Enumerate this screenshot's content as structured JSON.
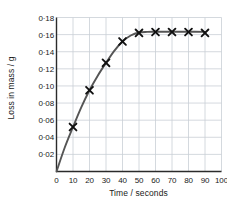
{
  "chart_data": {
    "type": "line",
    "title": "",
    "xlabel": "Time / seconds",
    "ylabel": "Loss in mass / g",
    "xlim": [
      0,
      100
    ],
    "ylim": [
      0,
      0.18
    ],
    "grid": true,
    "legend": null,
    "marker": "x-cross",
    "line_color": "#555555",
    "marker_color": "#111111",
    "grid_color": "#c9cfd6",
    "axis_color": "#2b2b2b",
    "x_tick_labels": [
      "0",
      "10",
      "20",
      "30",
      "40",
      "50",
      "60",
      "70",
      "80",
      "90",
      "100"
    ],
    "x_ticks": [
      0,
      10,
      20,
      30,
      40,
      50,
      60,
      70,
      80,
      90,
      100
    ],
    "y_tick_labels": [
      "0·02",
      "0·04",
      "0·06",
      "0·08",
      "0·10",
      "0·12",
      "0·14",
      "0·16",
      "0·18"
    ],
    "y_ticks": [
      0.02,
      0.04,
      0.06,
      0.08,
      0.1,
      0.12,
      0.14,
      0.16,
      0.18
    ],
    "series": [
      {
        "name": "Loss in mass",
        "x": [
          10,
          20,
          30,
          40,
          50,
          60,
          70,
          80,
          90
        ],
        "values": [
          0.052,
          0.095,
          0.127,
          0.152,
          0.162,
          0.163,
          0.163,
          0.163,
          0.162
        ]
      }
    ],
    "curve_points": [
      [
        0,
        0.0
      ],
      [
        5,
        0.028
      ],
      [
        10,
        0.052
      ],
      [
        15,
        0.075
      ],
      [
        20,
        0.095
      ],
      [
        25,
        0.112
      ],
      [
        30,
        0.127
      ],
      [
        35,
        0.141
      ],
      [
        40,
        0.152
      ],
      [
        45,
        0.159
      ],
      [
        50,
        0.1625
      ],
      [
        55,
        0.1632
      ],
      [
        60,
        0.1633
      ],
      [
        70,
        0.1633
      ],
      [
        80,
        0.1633
      ],
      [
        90,
        0.1632
      ]
    ]
  }
}
